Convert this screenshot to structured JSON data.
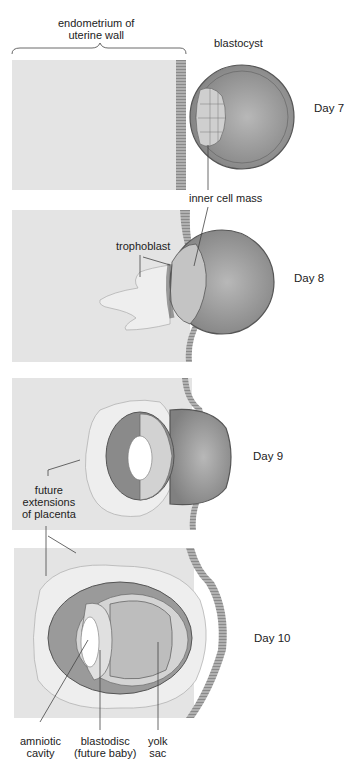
{
  "figure": {
    "type": "diagram",
    "labels": {
      "endometrium_line1": "endometrium of",
      "endometrium_line2": "uterine wall",
      "blastocyst": "blastocyst",
      "inner_cell_mass": "inner cell mass",
      "trophoblast": "trophoblast",
      "future_line1": "future",
      "future_line2": "extensions",
      "future_line3": "of placenta",
      "amniotic_line1": "amniotic",
      "amniotic_line2": "cavity",
      "blastodisc_line1": "blastodisc",
      "blastodisc_line2": "(future baby)",
      "yolk_line1": "yolk",
      "yolk_line2": "sac"
    },
    "panels": [
      {
        "day": "Day 7"
      },
      {
        "day": "Day 8"
      },
      {
        "day": "Day 9"
      },
      {
        "day": "Day 10"
      }
    ],
    "colors": {
      "endometrium": "#e4e4e4",
      "wall_stripe": "#9a9a9a",
      "blastocyst_fill": "#8c8c8c",
      "cell_outline": "#555555",
      "inner_cells": "#c8c8c8",
      "tissue_light": "#ececec"
    }
  }
}
